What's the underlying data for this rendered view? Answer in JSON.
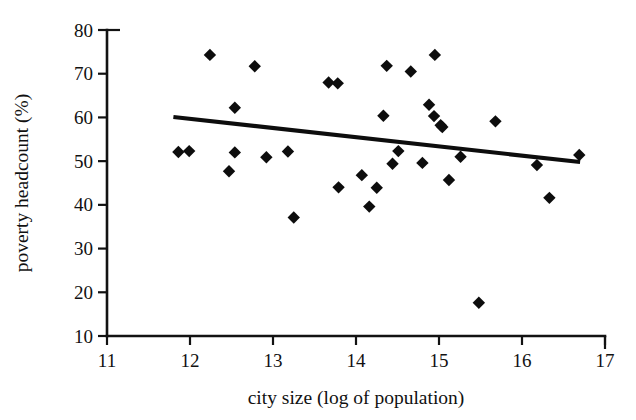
{
  "chart_data": {
    "type": "scatter",
    "title": "",
    "xlabel": "city size (log of population)",
    "ylabel": "poverty headcount (%)",
    "xlim": [
      11,
      17
    ],
    "ylim": [
      10,
      80
    ],
    "xticks": [
      11,
      12,
      13,
      14,
      15,
      16,
      17
    ],
    "yticks": [
      10,
      20,
      30,
      40,
      50,
      60,
      70,
      80
    ],
    "xtick_labels": [
      "11",
      "12",
      "13",
      "14",
      "15",
      "16",
      "17"
    ],
    "ytick_labels": [
      "10",
      "20",
      "30",
      "40",
      "50",
      "60",
      "70",
      "80"
    ],
    "grid": false,
    "legend": false,
    "legend_position": "none",
    "marker": "diamond",
    "marker_color": "#0d0d0d",
    "series": [
      {
        "name": "cities",
        "points": [
          [
            11.86,
            52.1
          ],
          [
            11.99,
            52.3
          ],
          [
            12.24,
            74.3
          ],
          [
            12.47,
            47.7
          ],
          [
            12.54,
            62.2
          ],
          [
            12.54,
            52.0
          ],
          [
            12.78,
            71.7
          ],
          [
            12.92,
            50.9
          ],
          [
            13.18,
            52.2
          ],
          [
            13.25,
            37.1
          ],
          [
            13.67,
            68.0
          ],
          [
            13.78,
            67.8
          ],
          [
            13.79,
            44.0
          ],
          [
            14.07,
            46.8
          ],
          [
            14.16,
            39.6
          ],
          [
            14.25,
            43.9
          ],
          [
            14.33,
            60.4
          ],
          [
            14.37,
            71.8
          ],
          [
            14.44,
            49.4
          ],
          [
            14.51,
            52.3
          ],
          [
            14.66,
            70.5
          ],
          [
            14.8,
            49.6
          ],
          [
            14.88,
            62.9
          ],
          [
            14.94,
            60.3
          ],
          [
            14.95,
            74.3
          ],
          [
            15.02,
            58.2
          ],
          [
            15.04,
            57.8
          ],
          [
            15.12,
            45.7
          ],
          [
            15.26,
            51.0
          ],
          [
            15.48,
            17.6
          ],
          [
            15.68,
            59.1
          ],
          [
            16.18,
            49.1
          ],
          [
            16.33,
            41.6
          ],
          [
            16.69,
            51.4
          ]
        ]
      }
    ],
    "trendline": {
      "type": "linear-fit",
      "x_start": 11.8,
      "y_start": 60.1,
      "x_end": 16.7,
      "y_end": 49.8,
      "color": "#0d0d0d",
      "slope": -2.1
    }
  }
}
